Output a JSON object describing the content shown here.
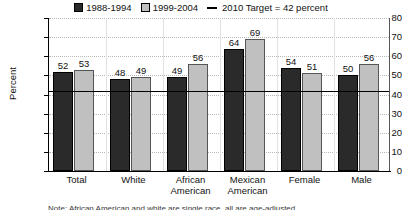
{
  "chart_data": {
    "type": "bar",
    "title": "",
    "xlabel": "",
    "ylabel": "Percent",
    "ylim": [
      0,
      80
    ],
    "ytick_step": 10,
    "yticks": [
      80,
      70,
      60,
      50,
      40,
      30,
      20,
      10,
      0
    ],
    "grid": true,
    "legend_position": "top-center",
    "categories": [
      "Total",
      "White",
      "African American",
      "Mexican American",
      "Female",
      "Male"
    ],
    "series": [
      {
        "name": "1988-1994",
        "color": "#2a2a2a",
        "values": [
          52,
          48,
          49,
          64,
          54,
          50
        ]
      },
      {
        "name": "1999-2004",
        "color": "#c0c0c0",
        "values": [
          53,
          49,
          56,
          69,
          51,
          56
        ]
      }
    ],
    "reference_line": {
      "label": "2010 Target = 42 percent",
      "value": 42,
      "color": "#000000"
    }
  },
  "legend": {
    "entries": [
      {
        "label": "1988-1994",
        "swatch": "series1-swatch"
      },
      {
        "label": "1999-2004",
        "swatch": "series2-swatch"
      },
      {
        "label": "2010 Target = 42 percent",
        "swatch": "target-line-mark"
      }
    ]
  },
  "axis": {
    "y_title": "Percent"
  },
  "footnote": {
    "text": "Note: African American and white are single race, all are age-adjusted."
  }
}
